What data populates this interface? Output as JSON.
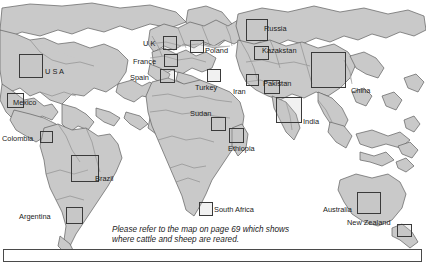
{
  "figure": {
    "type": "world-map",
    "caption": "Please refer to the map on page 69 which shows where cattle and sheep are reared.",
    "caption_line_1": "Please refer to the map on page 69 which shows",
    "caption_line_2": "where cattle and sheep are reared.",
    "page_reference": "69",
    "colors": {
      "land_fill": "#c9c9c9",
      "land_stroke": "#6f6f6f",
      "ocean": "#ffffff",
      "marker_border": "#3a3a3a",
      "text": "#1b1b1b"
    }
  },
  "markers": [
    {
      "id": "usa",
      "label": "U S A",
      "x": 19,
      "y": 54,
      "w": 24,
      "h": 24,
      "label_x": 45,
      "label_y": 68
    },
    {
      "id": "mexico",
      "label": "Mexico",
      "x": 7,
      "y": 93,
      "w": 17,
      "h": 15,
      "label_x": 13,
      "label_y": 99
    },
    {
      "id": "colombia",
      "label": "Colombia",
      "x": 40,
      "y": 131,
      "w": 13,
      "h": 12,
      "label_x": 2,
      "label_y": 135
    },
    {
      "id": "brazil",
      "label": "Brazil",
      "x": 71,
      "y": 155,
      "w": 28,
      "h": 27,
      "label_x": 95,
      "label_y": 175
    },
    {
      "id": "argentina",
      "label": "Argentina",
      "x": 66,
      "y": 207,
      "w": 17,
      "h": 17,
      "label_x": 19,
      "label_y": 213
    },
    {
      "id": "uk",
      "label": "U K",
      "x": 163,
      "y": 36,
      "w": 14,
      "h": 14,
      "label_x": 143,
      "label_y": 40
    },
    {
      "id": "france",
      "label": "France",
      "x": 164,
      "y": 54,
      "w": 14,
      "h": 13,
      "label_x": 133,
      "label_y": 58
    },
    {
      "id": "spain",
      "label": "Spain",
      "x": 160,
      "y": 69,
      "w": 15,
      "h": 14,
      "label_x": 130,
      "label_y": 74
    },
    {
      "id": "poland",
      "label": "Poland",
      "x": 190,
      "y": 40,
      "w": 14,
      "h": 13,
      "label_x": 205,
      "label_y": 47
    },
    {
      "id": "turkey",
      "label": "Turkey",
      "x": 207,
      "y": 69,
      "w": 14,
      "h": 13,
      "label_x": 195,
      "label_y": 84
    },
    {
      "id": "russia",
      "label": "Russia",
      "x": 246,
      "y": 19,
      "w": 22,
      "h": 22,
      "label_x": 264,
      "label_y": 25
    },
    {
      "id": "kazakstan",
      "label": "Kazakstan",
      "x": 254,
      "y": 46,
      "w": 15,
      "h": 14,
      "label_x": 262,
      "label_y": 47
    },
    {
      "id": "iran",
      "label": "Iran",
      "x": 246,
      "y": 74,
      "w": 13,
      "h": 12,
      "label_x": 233,
      "label_y": 88
    },
    {
      "id": "pakistan",
      "label": "Pakistan",
      "x": 264,
      "y": 80,
      "w": 16,
      "h": 14,
      "label_x": 263,
      "label_y": 80
    },
    {
      "id": "india",
      "label": "India",
      "x": 276,
      "y": 97,
      "w": 26,
      "h": 26,
      "label_x": 303,
      "label_y": 118
    },
    {
      "id": "china",
      "label": "China",
      "x": 311,
      "y": 52,
      "w": 35,
      "h": 36,
      "label_x": 351,
      "label_y": 87
    },
    {
      "id": "sudan",
      "label": "Sudan",
      "x": 211,
      "y": 117,
      "w": 15,
      "h": 14,
      "label_x": 190,
      "label_y": 110
    },
    {
      "id": "ethiopia",
      "label": "Ethiopia",
      "x": 229,
      "y": 128,
      "w": 15,
      "h": 15,
      "label_x": 228,
      "label_y": 145
    },
    {
      "id": "south-africa",
      "label": "South Africa",
      "x": 199,
      "y": 202,
      "w": 14,
      "h": 14,
      "label_x": 214,
      "label_y": 206
    },
    {
      "id": "australia",
      "label": "Australia",
      "x": 357,
      "y": 192,
      "w": 24,
      "h": 22,
      "label_x": 323,
      "label_y": 206
    },
    {
      "id": "new-zealand",
      "label": "New Zealand",
      "x": 397,
      "y": 224,
      "w": 15,
      "h": 13,
      "label_x": 347,
      "label_y": 219
    }
  ]
}
